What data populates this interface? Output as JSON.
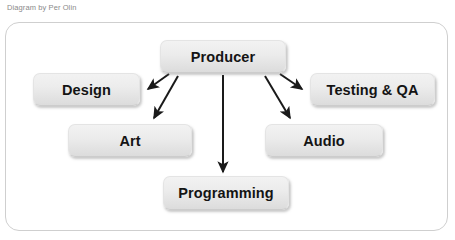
{
  "caption": "Diagram by Per Olin",
  "diagram": {
    "type": "org-chart",
    "title": "",
    "root": "Producer",
    "nodes": [
      {
        "id": "producer",
        "label": "Producer"
      },
      {
        "id": "design",
        "label": "Design"
      },
      {
        "id": "testing",
        "label": "Testing & QA"
      },
      {
        "id": "art",
        "label": "Art"
      },
      {
        "id": "audio",
        "label": "Audio"
      },
      {
        "id": "programming",
        "label": "Programming"
      }
    ],
    "edges": [
      {
        "from": "producer",
        "to": "design",
        "direction": "down-left"
      },
      {
        "from": "producer",
        "to": "art",
        "direction": "down-left"
      },
      {
        "from": "producer",
        "to": "programming",
        "direction": "down"
      },
      {
        "from": "producer",
        "to": "audio",
        "direction": "down-right"
      },
      {
        "from": "producer",
        "to": "testing",
        "direction": "down-right"
      }
    ]
  },
  "colors": {
    "background": "#ffffff",
    "frame_border": "#cfcfcf",
    "node_fill_top": "#f2f2f2",
    "node_fill_bottom": "#dcdcdc",
    "node_text": "#141414",
    "arrow": "#1a1a1a",
    "caption_text": "#8a8a8a"
  }
}
